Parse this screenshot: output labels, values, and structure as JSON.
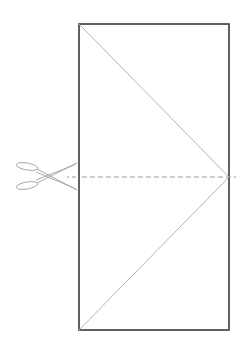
{
  "diagram": {
    "colors": {
      "border": "#3a3a3a",
      "fold_line": "#b0b0b0",
      "cut_line": "#9a9a9a",
      "scissors": "#9a9a9a",
      "background": "#ffffff"
    },
    "rectangle": {
      "x": 79,
      "y": 24,
      "width": 150,
      "height": 306
    },
    "fold_lines": [
      {
        "name": "upper-diagonal",
        "from": [
          79,
          24
        ],
        "to": [
          229,
          177
        ]
      },
      {
        "name": "lower-diagonal",
        "from": [
          79,
          330
        ],
        "to": [
          229,
          177
        ]
      }
    ],
    "cut_line": {
      "from": [
        67,
        177
      ],
      "to": [
        236,
        177
      ],
      "style": "dashed"
    },
    "icons": [
      {
        "name": "scissors-icon",
        "x": 15,
        "y": 163
      }
    ]
  }
}
